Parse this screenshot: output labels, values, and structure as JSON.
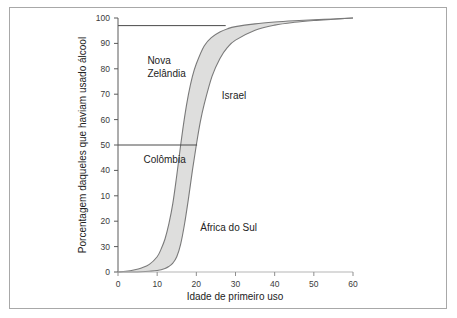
{
  "figure": {
    "frame_color": "#a8a8a8",
    "background": "#ffffff"
  },
  "chart_data": {
    "type": "line",
    "title": "",
    "subtitle": "",
    "xlabel": "Idade de primeiro uso",
    "ylabel": "Porcentagem daqueles que haviam usado álcool",
    "xlim": [
      0,
      60
    ],
    "ylim": [
      0,
      100
    ],
    "xticks": [
      0,
      10,
      20,
      30,
      40,
      50,
      60
    ],
    "xtick_labels": [
      "0",
      "10",
      "20",
      "30",
      "40",
      "50",
      "60"
    ],
    "yticks": [
      0,
      30,
      20,
      10,
      40,
      50,
      60,
      70,
      80,
      90,
      100
    ],
    "ytick_labels": [
      "0",
      "30",
      "20",
      "10",
      "40",
      "50",
      "60",
      "70",
      "80",
      "90",
      "100"
    ],
    "grid": false,
    "legend": "none",
    "band": {
      "name": "Faixa entre países",
      "fill_color": "#dededd",
      "line_color": "#7a7a7a",
      "description": "Área sombreada entre a curva de início mais precoce e a curva de início mais tardio"
    },
    "series": [
      {
        "name": "Curva superior (início mais precoce)",
        "color": "#7a7a7a",
        "x": [
          0,
          2,
          4,
          6,
          8,
          10,
          11,
          12,
          13,
          14,
          15,
          16,
          17,
          18,
          19,
          20,
          22,
          24,
          26,
          28,
          30,
          35,
          40,
          45,
          50,
          55,
          60
        ],
        "values": [
          0,
          0.3,
          0.8,
          1.6,
          3,
          6,
          9,
          13,
          19,
          27,
          38,
          50,
          61,
          70,
          77,
          82,
          89,
          92.5,
          94.5,
          95.8,
          96.6,
          97.7,
          98.4,
          98.9,
          99.3,
          99.6,
          100
        ]
      },
      {
        "name": "Curva inferior (início mais tardio)",
        "color": "#7a7a7a",
        "x": [
          0,
          2,
          4,
          6,
          8,
          10,
          12,
          13,
          14,
          15,
          16,
          17,
          18,
          19,
          20,
          21,
          22,
          24,
          26,
          28,
          30,
          35,
          40,
          45,
          50,
          55,
          60
        ],
        "values": [
          0,
          0,
          0,
          0.1,
          0.3,
          0.6,
          1.4,
          2.2,
          3.5,
          6,
          11,
          19,
          29,
          40,
          50,
          59,
          66,
          77,
          84,
          88.5,
          91.3,
          95.2,
          97.2,
          98.3,
          99,
          99.5,
          100
        ]
      }
    ],
    "reference_lines": [
      {
        "name": "linha-97",
        "orientation": "horizontal",
        "y": 97,
        "x_start": 0,
        "x_end": 27.5,
        "color": "#4a4a4a"
      },
      {
        "name": "linha-50",
        "orientation": "horizontal",
        "y": 50,
        "x_start": 0,
        "x_end": 20.2,
        "color": "#4a4a4a"
      }
    ],
    "annotations": [
      {
        "name": "nova-zelandia",
        "text_line1": "Nova",
        "text_line2": "Zelândia",
        "x": 7.5,
        "y": 82
      },
      {
        "name": "israel",
        "text": "Israel",
        "x": 26.5,
        "y": 68
      },
      {
        "name": "colombia",
        "text": "Colômbia",
        "x": 6.5,
        "y": 43
      },
      {
        "name": "africa-do-sul",
        "text": "África do Sul",
        "x": 21,
        "y": 16
      }
    ]
  }
}
